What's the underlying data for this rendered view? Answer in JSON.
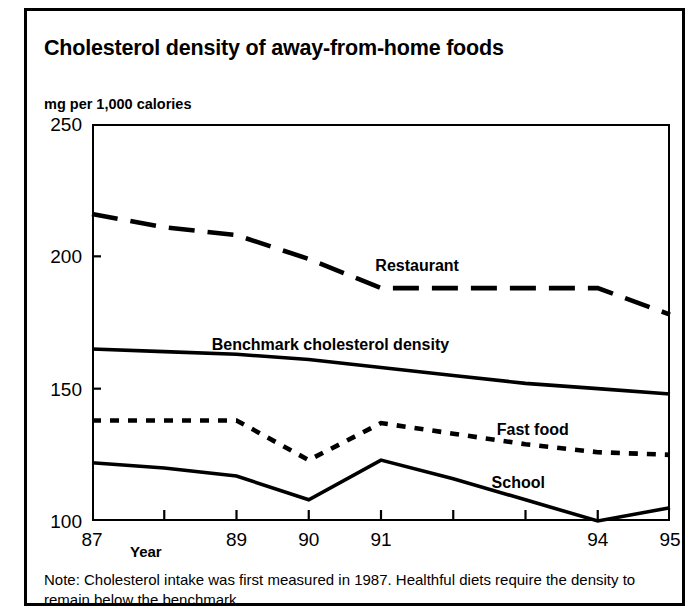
{
  "chart_data": {
    "type": "line",
    "title": "Cholesterol density of away-from-home foods",
    "ylabel": "mg per 1,000 calories",
    "xlabel": "Year",
    "ylim": [
      100,
      250
    ],
    "yticks": [
      100,
      150,
      200,
      250
    ],
    "ytick_labels": [
      "100",
      "150",
      "200",
      "250"
    ],
    "x": [
      87,
      88,
      89,
      90,
      91,
      92,
      93,
      94,
      95
    ],
    "xtick_labels": [
      "87",
      "",
      "89",
      "90",
      "91",
      "",
      "",
      "94",
      "95"
    ],
    "xlim": [
      87,
      95
    ],
    "grid": false,
    "legend_position": "inline-labels",
    "series": [
      {
        "name": "Restaurant",
        "style": "dashed",
        "values": [
          216,
          211,
          208,
          199,
          188,
          188,
          188,
          188,
          178
        ]
      },
      {
        "name": "Benchmark cholesterol density",
        "style": "solid",
        "values": [
          165,
          164,
          163,
          161,
          158,
          155,
          152,
          150,
          148
        ]
      },
      {
        "name": "Fast food",
        "style": "dotted",
        "values": [
          138,
          138,
          138,
          123,
          137,
          133,
          129,
          126,
          125
        ]
      },
      {
        "name": "School",
        "style": "solid",
        "values": [
          122,
          120,
          117,
          108,
          123,
          116,
          108,
          100,
          105
        ]
      }
    ],
    "annotations": [
      {
        "text": "Restaurant",
        "x": 91.5,
        "y": 196
      },
      {
        "text": "Benchmark cholesterol density",
        "x": 90.3,
        "y": 166
      },
      {
        "text": "Fast food",
        "x": 93.1,
        "y": 134
      },
      {
        "text": "School",
        "x": 92.9,
        "y": 114
      }
    ],
    "note": "Note: Cholesterol intake was first measured in 1987. Healthful diets require the density to remain below the benchmark."
  },
  "colors": {
    "ink": "#000000",
    "background": "#ffffff"
  }
}
